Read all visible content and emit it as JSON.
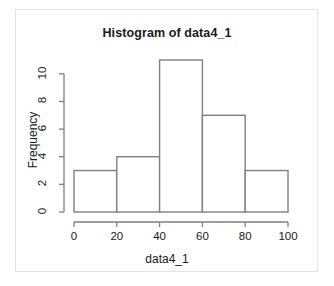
{
  "chart_data": {
    "type": "bar",
    "title": "Histogram of data4_1",
    "xlabel": "data4_1",
    "ylabel": "Frequency",
    "categories": [
      "0-20",
      "20-40",
      "40-60",
      "60-80",
      "80-100"
    ],
    "bin_edges": [
      0,
      20,
      40,
      60,
      80,
      100
    ],
    "values": [
      3,
      4,
      11,
      7,
      3
    ],
    "xlim": [
      0,
      100
    ],
    "ylim": [
      0,
      11
    ],
    "xticks": [
      0,
      20,
      40,
      60,
      80,
      100
    ],
    "yticks": [
      0,
      2,
      4,
      6,
      8,
      10
    ],
    "xtick_labels": [
      "0",
      "20",
      "40",
      "60",
      "80",
      "100"
    ],
    "ytick_labels": [
      "0",
      "2",
      "4",
      "6",
      "8",
      "10"
    ],
    "grid": false,
    "legend": null,
    "bar_fill": "#ffffff",
    "bar_stroke": "#808080",
    "axis_color": "#808080",
    "text_color": "#1a1a1a",
    "background": "#ffffff",
    "panel_border": "#e3e3e3"
  }
}
